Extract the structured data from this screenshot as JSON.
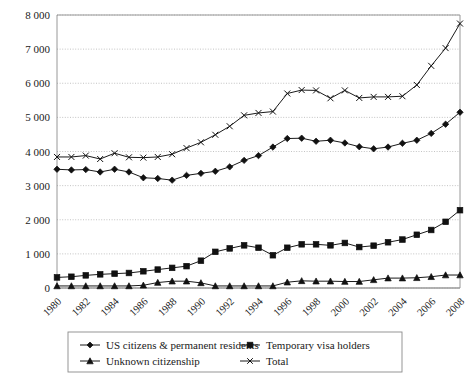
{
  "chart_data": {
    "type": "line",
    "title": "",
    "subtitle": "",
    "xlabel": "",
    "ylabel": "",
    "x": [
      1980,
      1981,
      1982,
      1983,
      1984,
      1985,
      1986,
      1987,
      1988,
      1989,
      1990,
      1991,
      1992,
      1993,
      1994,
      1995,
      1996,
      1997,
      1998,
      1999,
      2000,
      2001,
      2002,
      2003,
      2004,
      2005,
      2006,
      2007,
      2008
    ],
    "xtick_labels": [
      "1980",
      "1982",
      "1984",
      "1986",
      "1988",
      "1990",
      "1992",
      "1994",
      "1996",
      "1998",
      "2000",
      "2002",
      "2004",
      "2006",
      "2008"
    ],
    "xtick_values": [
      1980,
      1982,
      1984,
      1986,
      1988,
      1990,
      1992,
      1994,
      1996,
      1998,
      2000,
      2002,
      2004,
      2006,
      2008
    ],
    "ytick_labels": [
      "0",
      "1 000",
      "2 000",
      "3 000",
      "4 000",
      "5 000",
      "6 000",
      "7 000",
      "8 000"
    ],
    "ytick_values": [
      0,
      1000,
      2000,
      3000,
      4000,
      5000,
      6000,
      7000,
      8000
    ],
    "xlim": [
      1980,
      2008
    ],
    "ylim": [
      0,
      8000
    ],
    "grid": true,
    "grid_axis": "y",
    "legend_position": "bottom",
    "series": [
      {
        "name": "US citizens & permanent residents",
        "marker": "diamond",
        "values": [
          3480,
          3460,
          3470,
          3400,
          3480,
          3400,
          3230,
          3210,
          3160,
          3300,
          3360,
          3420,
          3550,
          3740,
          3880,
          4130,
          4380,
          4390,
          4300,
          4330,
          4250,
          4140,
          4080,
          4130,
          4240,
          4330,
          4530,
          4800,
          5150
        ]
      },
      {
        "name": "Temporary visa holders",
        "marker": "square",
        "values": [
          310,
          330,
          370,
          400,
          420,
          440,
          490,
          540,
          590,
          640,
          800,
          1060,
          1160,
          1250,
          1180,
          960,
          1180,
          1280,
          1280,
          1250,
          1320,
          1200,
          1240,
          1340,
          1420,
          1560,
          1700,
          1940,
          2280
        ]
      },
      {
        "name": "Unknown citizenship",
        "marker": "triangle",
        "values": [
          60,
          60,
          60,
          60,
          60,
          60,
          80,
          160,
          200,
          200,
          150,
          60,
          60,
          60,
          60,
          60,
          170,
          210,
          200,
          200,
          190,
          190,
          240,
          290,
          290,
          300,
          330,
          380,
          380
        ]
      },
      {
        "name": "Total",
        "marker": "x",
        "values": [
          3840,
          3840,
          3880,
          3780,
          3950,
          3830,
          3820,
          3840,
          3920,
          4100,
          4270,
          4490,
          4740,
          5060,
          5130,
          5170,
          5700,
          5800,
          5790,
          5560,
          5790,
          5570,
          5600,
          5600,
          5620,
          5950,
          6510,
          7030,
          7750
        ]
      }
    ]
  },
  "legend": {
    "entries": [
      {
        "label": "US citizens & permanent residents",
        "marker": "diamond"
      },
      {
        "label": "Temporary visa holders",
        "marker": "square"
      },
      {
        "label": "Unknown citizenship",
        "marker": "triangle"
      },
      {
        "label": "Total",
        "marker": "x"
      }
    ]
  },
  "colors": {
    "series": "#111111",
    "grid": "#b4b4b4",
    "axis": "#9a9a9a",
    "background": "#ffffff"
  }
}
